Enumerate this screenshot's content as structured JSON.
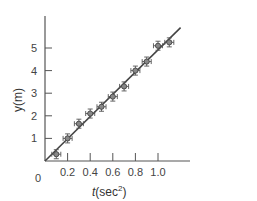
{
  "chart_data": {
    "type": "scatter",
    "title": "",
    "xlabel": "t(sec²)",
    "ylabel": "y(m)",
    "x_ticks": [
      "0.2",
      "0.4",
      "0.6",
      "0.8",
      "1.0"
    ],
    "y_ticks": [
      "1",
      "2",
      "3",
      "4",
      "5"
    ],
    "origin_label": "0",
    "xlim": [
      0,
      1.2
    ],
    "ylim": [
      0,
      6
    ],
    "grid": false,
    "legend": null,
    "series": [
      {
        "name": "measurements",
        "marker": "circle-with-error-bars",
        "x": [
          0.1,
          0.2,
          0.3,
          0.4,
          0.5,
          0.6,
          0.7,
          0.8,
          0.9,
          1.0,
          1.1
        ],
        "y": [
          0.3,
          1.0,
          1.65,
          2.1,
          2.4,
          2.85,
          3.3,
          4.0,
          4.4,
          5.1,
          5.25
        ],
        "x_err": 0.04,
        "y_err": 0.2
      },
      {
        "name": "best-fit line",
        "type": "line",
        "x": [
          0,
          1.2
        ],
        "y": [
          0,
          5.9
        ]
      }
    ]
  },
  "labels": {
    "origin": "0",
    "x_axis_prefix": "t",
    "x_axis_unit": "(sec",
    "x_axis_sup": "2",
    "x_axis_close": ")",
    "y_axis": "y(m)"
  }
}
